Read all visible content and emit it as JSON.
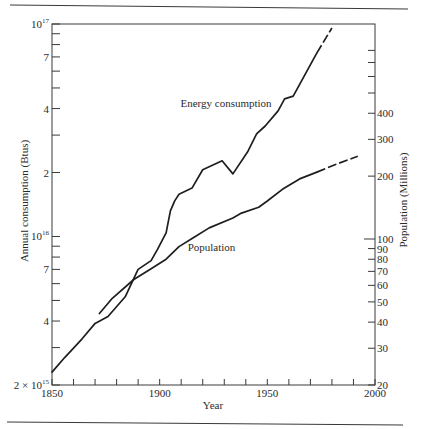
{
  "chart_data": {
    "type": "line",
    "title": "",
    "xlabel": "Year",
    "ylabel": "Annual consumption (Btus)",
    "y2label": "Population (Millions)",
    "xlim": [
      1850,
      2000
    ],
    "ylim": [
      2000000000000000.0,
      1e+17
    ],
    "yscale": "log",
    "y2lim": [
      20,
      1070
    ],
    "y2scale": "log",
    "grid": false,
    "legend": "none (curves labeled directly)",
    "x_ticks": [
      {
        "value": 1850,
        "label": "1850"
      },
      {
        "value": 1860
      },
      {
        "value": 1870
      },
      {
        "value": 1880
      },
      {
        "value": 1890
      },
      {
        "value": 1900,
        "label": "1900"
      },
      {
        "value": 1910
      },
      {
        "value": 1920
      },
      {
        "value": 1930
      },
      {
        "value": 1940
      },
      {
        "value": 1950,
        "label": "1950"
      },
      {
        "value": 1960
      },
      {
        "value": 1970
      },
      {
        "value": 1980
      },
      {
        "value": 1990
      },
      {
        "value": 2000,
        "label": "2000"
      }
    ],
    "y_ticks": [
      {
        "value": 1e+17,
        "label": "10",
        "exp": "17"
      },
      {
        "value": 9e+16
      },
      {
        "value": 8e+16
      },
      {
        "value": 7e+16,
        "label": "7"
      },
      {
        "value": 6e+16
      },
      {
        "value": 5e+16
      },
      {
        "value": 4e+16,
        "label": "4"
      },
      {
        "value": 3e+16
      },
      {
        "value": 2e+16,
        "label": "2"
      },
      {
        "value": 1e+16,
        "label": "10",
        "exp": "16"
      },
      {
        "value": 9000000000000000.0
      },
      {
        "value": 8000000000000000.0
      },
      {
        "value": 7000000000000000.0,
        "label": "7"
      },
      {
        "value": 6000000000000000.0
      },
      {
        "value": 5000000000000000.0
      },
      {
        "value": 4000000000000000.0,
        "label": "4"
      },
      {
        "value": 3000000000000000.0
      },
      {
        "value": 2000000000000000.0,
        "label": "2 × 10",
        "exp": "15"
      }
    ],
    "y2_ticks": [
      {
        "value": 800
      },
      {
        "value": 700
      },
      {
        "value": 600
      },
      {
        "value": 500
      },
      {
        "value": 400,
        "label": "400"
      },
      {
        "value": 300,
        "label": "300"
      },
      {
        "value": 200,
        "label": "200"
      },
      {
        "value": 100,
        "label": "100",
        "long": true
      },
      {
        "value": 90,
        "label": "90"
      },
      {
        "value": 80,
        "label": "80"
      },
      {
        "value": 70,
        "label": "70"
      },
      {
        "value": 60,
        "label": "60"
      },
      {
        "value": 50,
        "label": "50"
      },
      {
        "value": 40,
        "label": "40"
      },
      {
        "value": 30,
        "label": "30"
      },
      {
        "value": 20,
        "label": "20"
      }
    ],
    "series": [
      {
        "name": "Energy consumption",
        "axis": "left",
        "units": "Btus",
        "dashed_after_x": 1973,
        "x": [
          1850,
          1856,
          1864,
          1870,
          1876,
          1884,
          1890,
          1896,
          1899,
          1903,
          1905,
          1907,
          1909,
          1915,
          1920,
          1929,
          1934,
          1941,
          1945,
          1949,
          1955,
          1958,
          1962,
          1973,
          1980
        ],
        "values": [
          2300000000000000.0,
          2700000000000000.0,
          3300000000000000.0,
          3900000000000000.0,
          4200000000000000.0,
          5200000000000000.0,
          7000000000000000.0,
          7700000000000000.0,
          8700000000000000.0,
          1.04e+16,
          1.32e+16,
          1.47e+16,
          1.58e+16,
          1.69e+16,
          2.06e+16,
          2.27e+16,
          1.97e+16,
          2.52e+16,
          3.04e+16,
          3.31e+16,
          3.9e+16,
          4.44e+16,
          4.58e+16,
          7.31e+16,
          9.58e+16
        ]
      },
      {
        "name": "Population",
        "axis": "right",
        "units": "Millions",
        "dashed_after_x": 1973,
        "x": [
          1872,
          1878,
          1888,
          1896,
          1903,
          1909,
          1916,
          1923,
          1934,
          1938,
          1946,
          1950,
          1957,
          1965,
          1973,
          1982,
          1992
        ],
        "values": [
          44,
          52,
          64,
          72,
          80,
          92,
          102,
          113,
          126,
          133,
          142,
          152,
          173,
          194,
          209,
          228,
          249
        ]
      }
    ],
    "annotations": [
      {
        "text": "Energy consumption",
        "x": 1952,
        "y": 4.06e+16,
        "axis": "left",
        "anchor": "end"
      },
      {
        "text": "Population",
        "x": 1913,
        "y": 87.5,
        "axis": "right",
        "anchor": "start"
      }
    ]
  }
}
